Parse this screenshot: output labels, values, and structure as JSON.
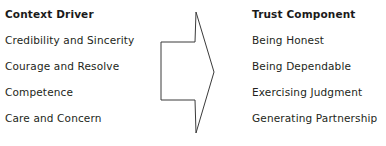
{
  "diagram": {
    "left_column": {
      "header": "Context Driver",
      "items": [
        "Credibility and Sincerity",
        "Courage and Resolve",
        "Competence",
        "Care and Concern"
      ],
      "clipped_item": ""
    },
    "right_column": {
      "header": "Trust Component",
      "items": [
        "Being Honest",
        "Being Dependable",
        "Exercising Judgment",
        "Generating Partnership"
      ],
      "clipped_item": ""
    },
    "arrow": {
      "direction": "right",
      "stroke_color": "#3a3a3a",
      "fill_color": "#ffffff"
    },
    "colors": {
      "text": "#231f20",
      "background": "#ffffff"
    }
  }
}
